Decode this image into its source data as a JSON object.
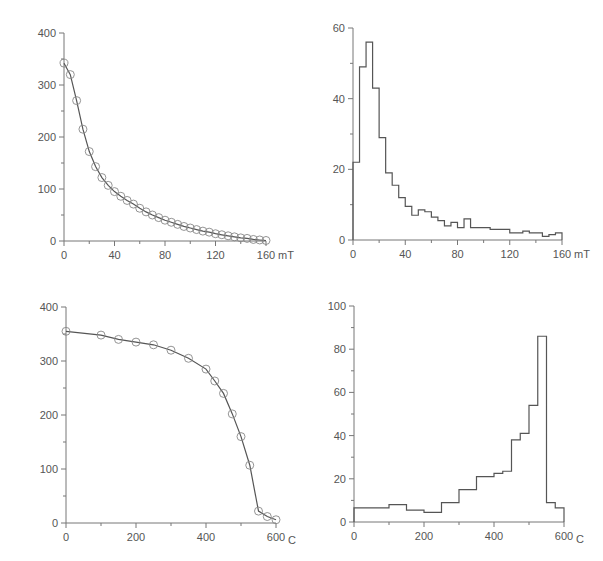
{
  "chart_data": [
    {
      "id": "af-demag",
      "type": "line",
      "title": "",
      "xlabel": "mT",
      "ylabel": "",
      "xlim": [
        0,
        160
      ],
      "ylim": [
        0,
        400
      ],
      "xticks": [
        0,
        40,
        80,
        120,
        160
      ],
      "yticks": [
        0,
        100,
        200,
        300,
        400
      ],
      "grid": false,
      "markers": "open-circle",
      "x": [
        0,
        5,
        10,
        15,
        20,
        25,
        30,
        35,
        40,
        45,
        50,
        55,
        60,
        65,
        70,
        75,
        80,
        85,
        90,
        95,
        100,
        105,
        110,
        115,
        120,
        125,
        130,
        135,
        140,
        145,
        150,
        155,
        160
      ],
      "values": [
        342,
        320,
        270,
        215,
        172,
        143,
        122,
        107,
        95,
        86,
        78,
        71,
        63,
        56,
        50,
        45,
        40,
        36,
        32,
        28,
        25,
        22,
        19,
        17,
        14,
        12,
        10,
        8,
        6,
        5,
        3,
        2,
        1
      ]
    },
    {
      "id": "af-histogram",
      "type": "bar",
      "style": "step-histogram",
      "title": "",
      "xlabel": "mT",
      "ylabel": "",
      "xlim": [
        0,
        160
      ],
      "ylim": [
        0,
        60
      ],
      "xticks": [
        0,
        40,
        80,
        120,
        160
      ],
      "yticks": [
        0,
        20,
        40,
        60
      ],
      "grid": false,
      "bin_edges": [
        0,
        5,
        10,
        15,
        20,
        25,
        30,
        35,
        40,
        45,
        50,
        55,
        60,
        65,
        70,
        75,
        80,
        85,
        90,
        95,
        100,
        105,
        110,
        115,
        120,
        125,
        130,
        135,
        140,
        145,
        150,
        155,
        160
      ],
      "values": [
        22,
        49,
        56,
        43,
        29,
        19,
        15.5,
        12,
        9.5,
        7,
        8.5,
        8,
        6.5,
        5.5,
        4,
        5,
        3.5,
        6,
        3.5,
        3.5,
        3.5,
        3,
        3,
        3,
        2,
        2,
        2.5,
        2,
        2,
        1,
        1.5,
        2
      ]
    },
    {
      "id": "thermal-demag",
      "type": "line",
      "title": "",
      "xlabel": "C",
      "ylabel": "",
      "xlim": [
        0,
        600
      ],
      "ylim": [
        0,
        400
      ],
      "xticks": [
        0,
        200,
        400,
        600
      ],
      "yticks": [
        0,
        100,
        200,
        300,
        400
      ],
      "grid": false,
      "markers": "open-circle",
      "x": [
        0,
        100,
        150,
        200,
        250,
        300,
        350,
        400,
        425,
        450,
        475,
        500,
        525,
        550,
        575,
        600
      ],
      "values": [
        355,
        348,
        340,
        335,
        330,
        320,
        305,
        285,
        263,
        240,
        202,
        160,
        107,
        22,
        12,
        6
      ]
    },
    {
      "id": "thermal-histogram",
      "type": "bar",
      "style": "step-histogram",
      "title": "",
      "xlabel": "C",
      "ylabel": "",
      "xlim": [
        0,
        600
      ],
      "ylim": [
        0,
        100
      ],
      "xticks": [
        0,
        200,
        400,
        600
      ],
      "yticks": [
        0,
        20,
        40,
        60,
        80,
        100
      ],
      "grid": false,
      "bin_edges": [
        0,
        100,
        150,
        200,
        250,
        300,
        350,
        400,
        425,
        450,
        475,
        500,
        525,
        550,
        575,
        600
      ],
      "values": [
        6.5,
        8,
        5.5,
        4.5,
        9,
        15,
        21,
        22.5,
        23.5,
        38,
        41,
        54,
        86,
        9,
        6.5
      ]
    }
  ],
  "panels": [
    {
      "x": 0,
      "y": 0,
      "w": 300,
      "h": 280,
      "ox": 64,
      "oy": 241,
      "px": 266,
      "py": 33
    },
    {
      "x": 300,
      "y": 0,
      "w": 303,
      "h": 280,
      "ox": 53,
      "oy": 240,
      "px": 262,
      "py": 28
    },
    {
      "x": 0,
      "y": 285,
      "w": 300,
      "h": 276,
      "ox": 66,
      "oy": 238,
      "px": 276,
      "py": 22
    },
    {
      "x": 300,
      "y": 285,
      "w": 303,
      "h": 276,
      "ox": 54,
      "oy": 237,
      "px": 264,
      "py": 21
    }
  ],
  "style": {
    "line_color": "#555555",
    "axis_color": "#777777",
    "text_color": "#555555"
  }
}
